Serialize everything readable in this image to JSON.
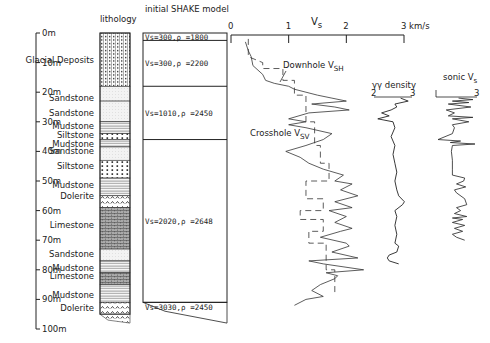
{
  "chart_data": {
    "type": "line",
    "title": "",
    "depth_axis": {
      "label_unit": "m",
      "ticks": [
        "0m",
        "10m",
        "20m",
        "30m",
        "40m",
        "50m",
        "60m",
        "70m",
        "80m",
        "90m",
        "100m"
      ],
      "range": [
        0,
        100
      ]
    },
    "columns": {
      "lithology": {
        "title": "lithology",
        "layers": [
          {
            "name": "Glacial Deposits",
            "top": 0,
            "bottom": 18,
            "pattern": "dots-dense"
          },
          {
            "name": "Sandstone",
            "top": 18,
            "bottom": 23,
            "pattern": "fine"
          },
          {
            "name": "Sandstone",
            "top": 23,
            "bottom": 30,
            "pattern": "fine"
          },
          {
            "name": "Mudstone",
            "top": 30,
            "bottom": 34,
            "pattern": "hlines"
          },
          {
            "name": "Siltstone",
            "top": 34,
            "bottom": 36,
            "pattern": "dots"
          },
          {
            "name": "Mudstone",
            "top": 36,
            "bottom": 38.5,
            "pattern": "hlines"
          },
          {
            "name": "Sandstone",
            "top": 38.5,
            "bottom": 43,
            "pattern": "fine"
          },
          {
            "name": "Siltstone",
            "top": 43,
            "bottom": 49,
            "pattern": "dots"
          },
          {
            "name": "Mudstone",
            "top": 49,
            "bottom": 55,
            "pattern": "hlines"
          },
          {
            "name": "Dolerite",
            "top": 55,
            "bottom": 59,
            "pattern": "carets"
          },
          {
            "name": "Limestone",
            "top": 59,
            "bottom": 73,
            "pattern": "bricks"
          },
          {
            "name": "Sandstone",
            "top": 73,
            "bottom": 77,
            "pattern": "fine"
          },
          {
            "name": "Mudstone",
            "top": 77,
            "bottom": 81,
            "pattern": "hlines"
          },
          {
            "name": "Limestone",
            "top": 81,
            "bottom": 85,
            "pattern": "bricks"
          },
          {
            "name": "Mudstone",
            "top": 85,
            "bottom": 91,
            "pattern": "hlines"
          },
          {
            "name": "Dolerite",
            "top": 91,
            "bottom": 95,
            "pattern": "carets"
          }
        ],
        "labels": [
          {
            "text": "Glacial Deposits",
            "depth": 9
          },
          {
            "text": "Sandstone",
            "depth": 22
          },
          {
            "text": "Sandstone",
            "depth": 27
          },
          {
            "text": "Mudstone",
            "depth": 31.5
          },
          {
            "text": "Siltstone",
            "depth": 34.5
          },
          {
            "text": "Mudstone",
            "depth": 37.5
          },
          {
            "text": "Sandstone",
            "depth": 40
          },
          {
            "text": "Siltstone",
            "depth": 45
          },
          {
            "text": "Mudstone",
            "depth": 51.5
          },
          {
            "text": "Dolerite",
            "depth": 55
          },
          {
            "text": "Limestone",
            "depth": 65
          },
          {
            "text": "Sandstone",
            "depth": 74.5
          },
          {
            "text": "Mudstone",
            "depth": 79.5
          },
          {
            "text": "Limestone",
            "depth": 82
          },
          {
            "text": "Mudstone",
            "depth": 88.5
          },
          {
            "text": "Dolerite",
            "depth": 93
          }
        ]
      },
      "shake_model": {
        "title": "initial SHAKE model",
        "layers": [
          {
            "label": "Vs=300,ρ =1800",
            "top": 0,
            "bottom": 2.5
          },
          {
            "label": "Vs=300,ρ =2200",
            "top": 2.5,
            "bottom": 18
          },
          {
            "label": "Vs=1010,ρ =2450",
            "top": 18,
            "bottom": 36
          },
          {
            "label": "Vs=2020,ρ =2648",
            "top": 36,
            "bottom": 91
          },
          {
            "label": "Vs=3030,ρ =2450",
            "top": 91,
            "bottom": 100
          }
        ]
      },
      "vs_profile": {
        "axis_title": "V",
        "axis_title_sub": "s",
        "x_ticks": [
          "0",
          "1",
          "2",
          "3 km/s"
        ],
        "x_range": [
          0,
          3
        ],
        "series": [
          {
            "name": "Downhole V",
            "name_sub": "SH",
            "style": "dashed"
          },
          {
            "name": "Crosshole V",
            "name_sub": "SV",
            "style": "solid"
          }
        ]
      },
      "density": {
        "title": "γγ density",
        "x_ticks": [
          "2",
          "3"
        ],
        "x_range": [
          2,
          3
        ]
      },
      "sonic": {
        "title": "sonic V",
        "title_sub": "s",
        "x_ticks": [
          "1",
          "3"
        ],
        "x_range": [
          1,
          3
        ]
      }
    }
  },
  "layout": {
    "y0": 33,
    "px_per_m": 2.96
  },
  "colors": {
    "ink": "#222222",
    "background": "#ffffff"
  }
}
